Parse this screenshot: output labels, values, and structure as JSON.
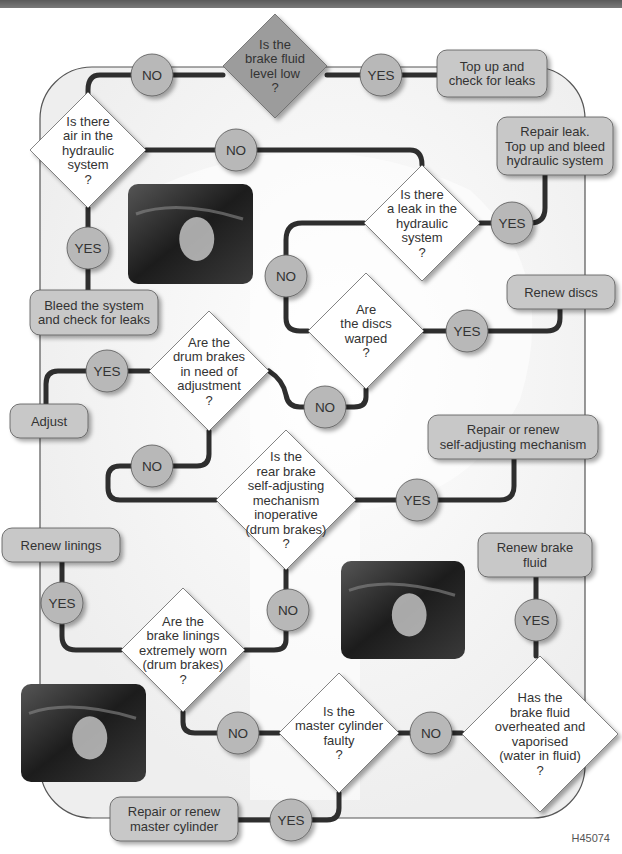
{
  "diagram": {
    "figure_id": "H45074",
    "colors": {
      "topbar": "#666666",
      "frame_stroke": "#555555",
      "frame_fill": "#f4f4f4",
      "diamond_fill": "#ffffff",
      "diamond_start_fill": "#9c9c9c",
      "box_fill": "#c8c8c8",
      "circle_fill": "#b8b8b8",
      "line": "#2e2e2e",
      "text": "#333333"
    },
    "decisions": [
      {
        "id": "fluid-low",
        "lines": [
          "Is the",
          "brake fluid",
          "level low",
          "?"
        ],
        "cx": 275,
        "cy": 66,
        "r": 52,
        "start": true
      },
      {
        "id": "air",
        "lines": [
          "Is there",
          "air in the",
          "hydraulic",
          "system",
          "?"
        ],
        "cx": 88,
        "cy": 150,
        "r": 58
      },
      {
        "id": "leak",
        "lines": [
          "Is there",
          "a leak in the",
          "hydraulic",
          "system",
          "?"
        ],
        "cx": 422,
        "cy": 223,
        "r": 58
      },
      {
        "id": "discs",
        "lines": [
          "Are",
          "the discs",
          "warped",
          "?"
        ],
        "cx": 366,
        "cy": 331,
        "r": 58
      },
      {
        "id": "drum-adjust",
        "lines": [
          "Are the",
          "drum brakes",
          "in need of",
          "adjustment",
          "?"
        ],
        "cx": 209,
        "cy": 371,
        "r": 60
      },
      {
        "id": "self-adjust",
        "lines": [
          "Is the",
          "rear brake",
          "self-adjusting",
          "mechanism",
          "inoperative",
          "(drum brakes)",
          "?"
        ],
        "cx": 286,
        "cy": 500,
        "r": 70
      },
      {
        "id": "linings",
        "lines": [
          "Are the",
          "brake linings",
          "extremely worn",
          "(drum brakes)",
          "?"
        ],
        "cx": 183,
        "cy": 650,
        "r": 62
      },
      {
        "id": "master",
        "lines": [
          "Is the",
          "master cylinder",
          "faulty",
          "?"
        ],
        "cx": 339,
        "cy": 733,
        "r": 60
      },
      {
        "id": "overheat",
        "lines": [
          "Has the",
          "brake fluid",
          "overheated and",
          "vaporised",
          "(water in fluid)",
          "?"
        ],
        "cx": 540,
        "cy": 734,
        "r": 78
      }
    ],
    "actions": [
      {
        "id": "top-up",
        "lines": [
          "Top up and",
          "check for leaks"
        ],
        "x": 437,
        "y": 50,
        "w": 110,
        "h": 47
      },
      {
        "id": "repair-leak",
        "lines": [
          "Repair leak.",
          "Top up and bleed",
          "hydraulic system"
        ],
        "x": 497,
        "y": 117,
        "w": 116,
        "h": 58
      },
      {
        "id": "bleed",
        "lines": [
          "Bleed the system",
          "and check for leaks"
        ],
        "x": 30,
        "y": 290,
        "w": 128,
        "h": 45
      },
      {
        "id": "renew-discs",
        "lines": [
          "Renew discs"
        ],
        "x": 507,
        "y": 275,
        "w": 108,
        "h": 34
      },
      {
        "id": "adjust",
        "lines": [
          "Adjust"
        ],
        "x": 10,
        "y": 404,
        "w": 78,
        "h": 34
      },
      {
        "id": "renew-self-adjust",
        "lines": [
          "Repair or renew",
          "self-adjusting mechanism"
        ],
        "x": 428,
        "y": 415,
        "w": 170,
        "h": 44
      },
      {
        "id": "renew-linings",
        "lines": [
          "Renew linings"
        ],
        "x": 2,
        "y": 528,
        "w": 118,
        "h": 34
      },
      {
        "id": "renew-fluid",
        "lines": [
          "Renew brake",
          "fluid"
        ],
        "x": 478,
        "y": 533,
        "w": 114,
        "h": 44
      },
      {
        "id": "renew-master",
        "lines": [
          "Repair or renew",
          "master cylinder"
        ],
        "x": 110,
        "y": 797,
        "w": 128,
        "h": 44
      }
    ],
    "connectors": [
      {
        "id": "c1",
        "label": "NO",
        "cx": 152,
        "cy": 75
      },
      {
        "id": "c2",
        "label": "YES",
        "cx": 381,
        "cy": 75
      },
      {
        "id": "c3",
        "label": "NO",
        "cx": 236,
        "cy": 150
      },
      {
        "id": "c4",
        "label": "YES",
        "cx": 512,
        "cy": 223
      },
      {
        "id": "c5",
        "label": "YES",
        "cx": 88,
        "cy": 248
      },
      {
        "id": "c6",
        "label": "NO",
        "cx": 286,
        "cy": 276
      },
      {
        "id": "c7",
        "label": "YES",
        "cx": 467,
        "cy": 331
      },
      {
        "id": "c8",
        "label": "YES",
        "cx": 107,
        "cy": 371
      },
      {
        "id": "c9",
        "label": "NO",
        "cx": 325,
        "cy": 407
      },
      {
        "id": "c10",
        "label": "NO",
        "cx": 152,
        "cy": 466
      },
      {
        "id": "c11",
        "label": "YES",
        "cx": 417,
        "cy": 500
      },
      {
        "id": "c12",
        "label": "YES",
        "cx": 62,
        "cy": 603
      },
      {
        "id": "c13",
        "label": "NO",
        "cx": 288,
        "cy": 610
      },
      {
        "id": "c14",
        "label": "YES",
        "cx": 536,
        "cy": 620
      },
      {
        "id": "c15",
        "label": "NO",
        "cx": 238,
        "cy": 733
      },
      {
        "id": "c16",
        "label": "NO",
        "cx": 431,
        "cy": 733
      },
      {
        "id": "c17",
        "label": "YES",
        "cx": 291,
        "cy": 820
      }
    ],
    "photos": [
      {
        "id": "reservoir-photo",
        "caption": "Brake fluid reservoir in engine bay",
        "x": 128,
        "y": 184,
        "w": 125,
        "h": 100
      },
      {
        "id": "fluid-check-photo",
        "caption": "Checking brake fluid reservoir",
        "x": 341,
        "y": 561,
        "w": 124,
        "h": 98
      },
      {
        "id": "drum-photo",
        "caption": "Drum brake adjuster",
        "x": 21,
        "y": 684,
        "w": 125,
        "h": 98
      }
    ]
  }
}
